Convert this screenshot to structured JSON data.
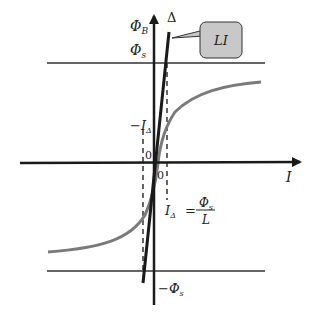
{
  "diagram": {
    "labels": {
      "y_axis": "Φ",
      "y_axis_sub": "B",
      "delta_line": "Δ",
      "phi_s": "Φ",
      "phi_s_sub": "s",
      "neg_phi_s_prefix": "−Φ",
      "neg_phi_s_sub": "s",
      "neg_i_delta_prefix": "−I",
      "neg_i_delta_sub": "Δ",
      "origin_upper": "0",
      "origin_lower": "0",
      "x_axis": "I",
      "callout": "LI",
      "formula_lhs": "I",
      "formula_lhs_sub": "Δ",
      "formula_eq": "=",
      "formula_num": "Φ",
      "formula_num_sub": "s",
      "formula_den": "L"
    },
    "colors": {
      "axis": "#1a1a1a",
      "curve": "#7a7a7a",
      "callout_fill": "#c8c8c8",
      "guide_line": "#333333"
    }
  }
}
